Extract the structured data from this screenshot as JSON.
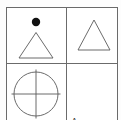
{
  "figure": {
    "type": "visual-analogy-matrix",
    "rows": 2,
    "columns": 2,
    "stroke_color": "#6b6b6b",
    "shape_stroke_color": "#5a5a5a",
    "fill_color": "#000000",
    "background_color": "#ffffff"
  },
  "cells": [
    {
      "position": "top-left",
      "label": "",
      "shapes": [
        {
          "name": "filled-circle-dot",
          "fill": "#111111",
          "outline": false
        },
        {
          "name": "triangle-outline",
          "fill": "none",
          "outline": true
        }
      ]
    },
    {
      "position": "top-right",
      "label": "",
      "shapes": [
        {
          "name": "triangle-outline",
          "fill": "none",
          "outline": true
        }
      ]
    },
    {
      "position": "bottom-left",
      "label": "",
      "shapes": [
        {
          "name": "circle-with-cross-outline",
          "fill": "none",
          "outline": true
        }
      ]
    },
    {
      "position": "bottom-right",
      "label": "A",
      "shapes": []
    }
  ]
}
